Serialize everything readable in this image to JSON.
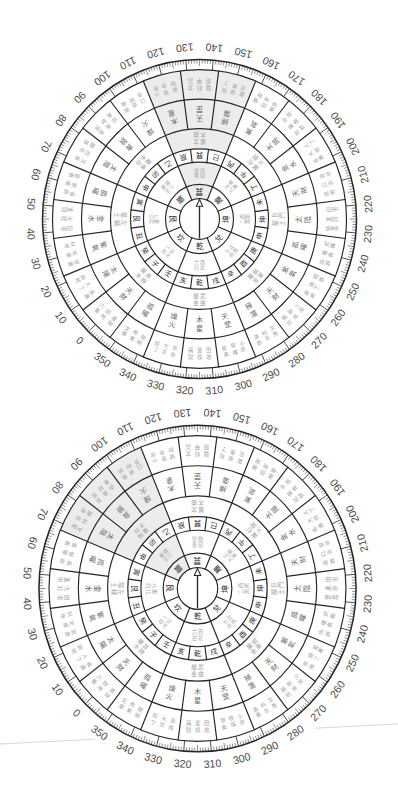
{
  "style": {
    "background": "#ffffff",
    "line_color": "#262626",
    "highlight_fill": "#ececec",
    "degree_label_color": "#4a4a4a",
    "trigram_text_color": "#2e2e2e",
    "mountain_text_color": "#333333",
    "star_text_color": "#6b6b6b",
    "note_text_color": "#a3a3a3",
    "edge_line_color": "#d2d2d2"
  },
  "degree_scale": {
    "labels": [
      "0",
      "10",
      "20",
      "30",
      "40",
      "50",
      "60",
      "70",
      "80",
      "90",
      "100",
      "110",
      "120",
      "130",
      "140",
      "150",
      "160",
      "170",
      "180",
      "190",
      "200",
      "210",
      "220",
      "230",
      "240",
      "250",
      "260",
      "270",
      "280",
      "290",
      "300",
      "310",
      "320",
      "330",
      "340",
      "350"
    ],
    "minor_tick_deg": 1,
    "medium_tick_deg": 5,
    "major_tick_deg": 10
  },
  "dials": [
    {
      "name": "upper",
      "top_bearing_deg": 135,
      "needle_bearing_deg": 135,
      "highlight": {
        "trigram": "巽",
        "center_deg": 135,
        "span_deg": 45
      }
    },
    {
      "name": "lower",
      "top_bearing_deg": 135,
      "needle_bearing_deg": 135,
      "highlight": {
        "trigram": "震",
        "center_deg": 90,
        "span_deg": 45
      }
    }
  ],
  "trigrams": [
    {
      "bearing": 0,
      "name": "坎",
      "ring2": [
        "正北",
        "一白"
      ],
      "ring4": [
        "貪狼",
        "屬水"
      ]
    },
    {
      "bearing": 45,
      "name": "艮",
      "ring2": [
        "東北",
        "八白"
      ],
      "ring4": [
        "左輔",
        "屬土"
      ]
    },
    {
      "bearing": 90,
      "name": "震",
      "ring2": [
        "正東",
        "三碧"
      ],
      "ring4": [
        "祿存",
        "屬木"
      ]
    },
    {
      "bearing": 135,
      "name": "巽",
      "ring2": [
        "東南",
        "四綠"
      ],
      "ring4": [
        "文曲",
        "屬木"
      ]
    },
    {
      "bearing": 180,
      "name": "離",
      "ring2": [
        "正南",
        "九紫"
      ],
      "ring4": [
        "右弼",
        "屬火"
      ]
    },
    {
      "bearing": 225,
      "name": "坤",
      "ring2": [
        "西南",
        "二黑"
      ],
      "ring4": [
        "巨門",
        "屬土"
      ]
    },
    {
      "bearing": 270,
      "name": "兌",
      "ring2": [
        "正西",
        "七赤"
      ],
      "ring4": [
        "破軍",
        "屬金"
      ]
    },
    {
      "bearing": 315,
      "name": "乾",
      "ring2": [
        "西北",
        "六白"
      ],
      "ring4": [
        "武曲",
        "屬金"
      ]
    }
  ],
  "mountains": [
    {
      "bearing": 0,
      "name": "子",
      "star": "天財",
      "notes": [
        "進財",
        "田地",
        "六畜"
      ]
    },
    {
      "bearing": 15,
      "name": "癸",
      "star": "太陽",
      "notes": [
        "長壽",
        "人丁",
        "興旺"
      ]
    },
    {
      "bearing": 30,
      "name": "丑",
      "star": "紫氣",
      "notes": [
        "官貴",
        "文章",
        "科甲"
      ]
    },
    {
      "bearing": 45,
      "name": "艮",
      "star": "金水",
      "notes": [
        "田宅",
        "大旺",
        "進財"
      ]
    },
    {
      "bearing": 60,
      "name": "寅",
      "star": "孤曜",
      "notes": [
        "長房",
        "發福",
        "富貴"
      ]
    },
    {
      "bearing": 75,
      "name": "甲",
      "star": "太陰",
      "notes": [
        "文星",
        "科名",
        "顯達"
      ]
    },
    {
      "bearing": 90,
      "name": "卯",
      "star": "貪狼",
      "notes": [
        "長房",
        "進財",
        "田產"
      ]
    },
    {
      "bearing": 105,
      "name": "乙",
      "star": "燥火",
      "notes": [
        "疾病",
        "退財",
        "口舌"
      ]
    },
    {
      "bearing": 120,
      "name": "辰",
      "star": "木星",
      "notes": [
        "小房",
        "官非",
        "破財"
      ]
    },
    {
      "bearing": 135,
      "name": "巽",
      "star": "天罡",
      "notes": [
        "文昌",
        "科甲",
        "聰明"
      ]
    },
    {
      "bearing": 150,
      "name": "巳",
      "star": "掃蕩",
      "notes": [
        "旺丁",
        "發貴",
        "富足"
      ]
    },
    {
      "bearing": 165,
      "name": "丙",
      "star": "紫氣",
      "notes": [
        "橫財",
        "田地",
        "進祿"
      ]
    },
    {
      "bearing": 180,
      "name": "午",
      "star": "太陽",
      "notes": [
        "中房",
        "富貴",
        "旺財"
      ]
    },
    {
      "bearing": 195,
      "name": "丁",
      "star": "金水",
      "notes": [
        "人丁",
        "大旺",
        "長壽"
      ]
    },
    {
      "bearing": 210,
      "name": "未",
      "star": "天財",
      "notes": [
        "官非",
        "口舌",
        "退敗"
      ]
    },
    {
      "bearing": 225,
      "name": "坤",
      "star": "太陰",
      "notes": [
        "田宅",
        "進財",
        "豐盈"
      ]
    },
    {
      "bearing": 240,
      "name": "申",
      "star": "孤曜",
      "notes": [
        "武職",
        "權貴",
        "出將"
      ]
    },
    {
      "bearing": 255,
      "name": "庚",
      "star": "紫氣",
      "notes": [
        "孤寡",
        "損丁",
        "疾病"
      ]
    },
    {
      "bearing": 270,
      "name": "酉",
      "star": "天財",
      "notes": [
        "少房",
        "財帛",
        "興旺"
      ]
    },
    {
      "bearing": 285,
      "name": "辛",
      "star": "掃蕩",
      "notes": [
        "文秀",
        "科名",
        "清貴"
      ]
    },
    {
      "bearing": 300,
      "name": "戌",
      "star": "天罡",
      "notes": [
        "小房",
        "發福",
        "官貴"
      ]
    },
    {
      "bearing": 315,
      "name": "乾",
      "star": "木星",
      "notes": [
        "田地",
        "進祿",
        "橫財"
      ]
    },
    {
      "bearing": 330,
      "name": "亥",
      "star": "燥火",
      "notes": [
        "長房",
        "大吉",
        "旺丁"
      ]
    },
    {
      "bearing": 345,
      "name": "壬",
      "star": "孤曜",
      "notes": [
        "聰明",
        "秀氣",
        "文章"
      ]
    }
  ]
}
